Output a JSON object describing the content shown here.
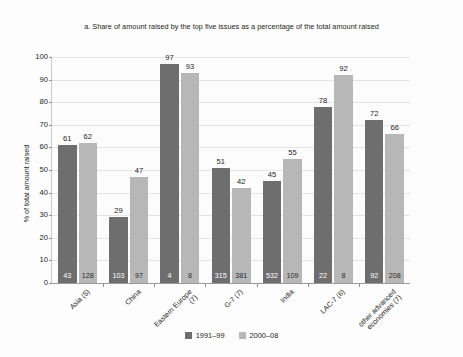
{
  "chart_data": {
    "type": "bar",
    "title": "a. Share of amount raised by the top five issues as a percentage of the total amount raised",
    "xlabel": "",
    "ylabel": "% of total amount raised",
    "ylim": [
      0,
      100
    ],
    "yticks": [
      0,
      10,
      20,
      30,
      40,
      50,
      60,
      70,
      80,
      90,
      100
    ],
    "grid": true,
    "legend_position": "bottom-center",
    "categories": [
      "Asia (5)",
      "China",
      "Eastern Europe (7)",
      "G-7 (7)",
      "India",
      "LAC-7 (6)",
      "other advanced economies (7)"
    ],
    "series": [
      {
        "name": "1991–99",
        "color": "#6e6e6e",
        "values": [
          61,
          29,
          97,
          51,
          45,
          78,
          72
        ],
        "inner_labels": [
          43,
          103,
          4,
          315,
          532,
          22,
          92
        ]
      },
      {
        "name": "2000–08",
        "color": "#b7b7b7",
        "values": [
          62,
          47,
          93,
          42,
          55,
          92,
          66
        ],
        "inner_labels": [
          128,
          97,
          8,
          381,
          109,
          8,
          208
        ]
      }
    ]
  },
  "legend": {
    "items": [
      {
        "label": "1991–99",
        "color": "#6e6e6e"
      },
      {
        "label": "2000–08",
        "color": "#b7b7b7"
      }
    ]
  },
  "colors": {
    "series_1991_99": "#6e6e6e",
    "series_2000_08": "#b7b7b7",
    "gridline": "#e4e4e4",
    "axis": "#9a9a9a",
    "text": "#231f20",
    "background": "#ffffff"
  }
}
